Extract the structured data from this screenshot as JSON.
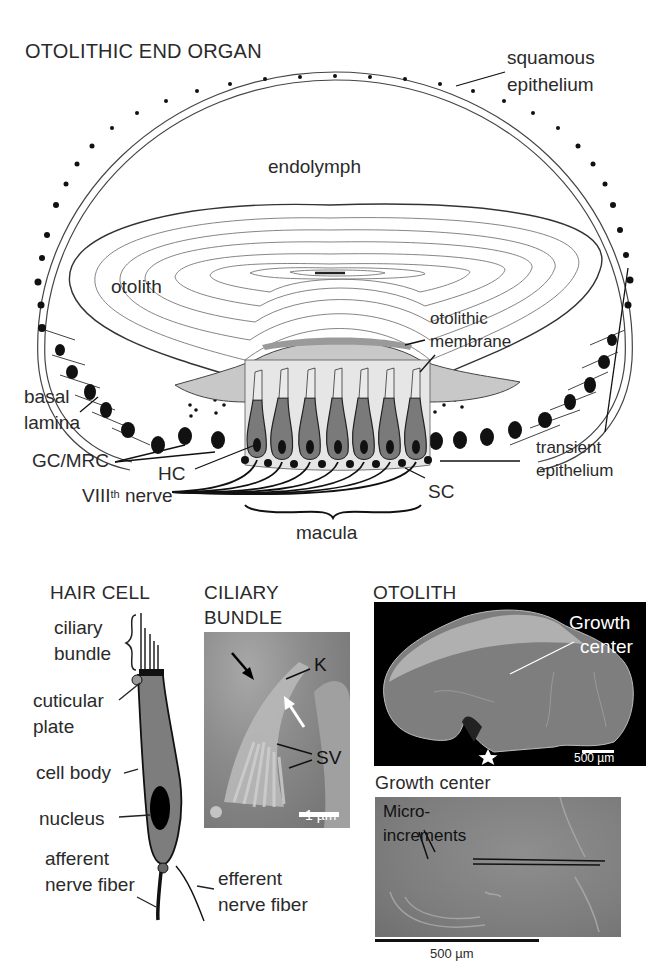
{
  "top_panel": {
    "title": "OTOLITHIC END ORGAN",
    "labels": {
      "squamous_1": "squamous",
      "squamous_2": "epithelium",
      "endolymph": "endolymph",
      "otolith": "otolith",
      "otolithic_membrane_1": "otolithic",
      "otolithic_membrane_2": "membrane",
      "basal_lamina_1": "basal",
      "basal_lamina_2": "lamina",
      "gc_mrc": "GC/MRC",
      "hc": "HC",
      "viii_nerve_pre": "VIII",
      "viii_nerve_sup": "th",
      "viii_nerve_post": " nerve",
      "sc": "SC",
      "macula": "macula",
      "transient_1": "transient",
      "transient_2": "epithelium"
    }
  },
  "hair_cell_panel": {
    "title": "HAIR CELL",
    "labels": {
      "ciliary_1": "ciliary",
      "ciliary_2": "bundle",
      "cuticular_1": "cuticular",
      "cuticular_2": "plate",
      "cell_body": "cell body",
      "nucleus": "nucleus",
      "afferent_1": "afferent",
      "afferent_2": "nerve fiber",
      "efferent_1": "efferent",
      "efferent_2": "nerve fiber"
    }
  },
  "ciliary_bundle_panel": {
    "title_1": "CILIARY",
    "title_2": "BUNDLE",
    "labels": {
      "k": "K",
      "sv": "SV"
    },
    "scale_bar": "1 µm"
  },
  "otolith_panel": {
    "title": "OTOLITH",
    "labels": {
      "growth_1": "Growth",
      "growth_2": "center"
    },
    "scale_bar": "500 µm"
  },
  "growth_center_panel": {
    "title": "Growth center",
    "labels": {
      "micro_1": "Micro-",
      "micro_2": "increments"
    },
    "scale_bar": "500 µm"
  },
  "colors": {
    "hair_cell_fill": "#7a7a7a",
    "membrane_fill": "#c8c8c8",
    "macula_fill": "#e6e6e6",
    "sem_bg": "#8a8a8a",
    "otolith_bg": "#000000"
  }
}
